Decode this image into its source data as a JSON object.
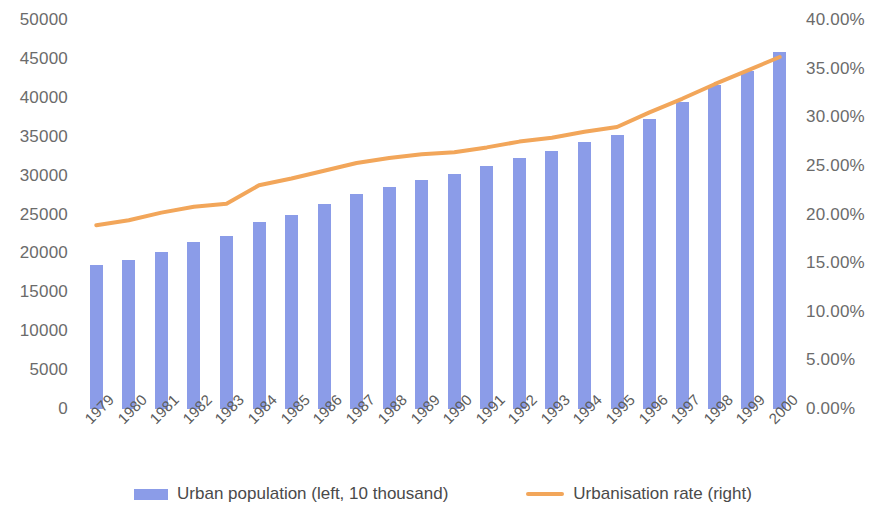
{
  "chart_data": {
    "type": "bar",
    "title": "",
    "subtitle": "",
    "xlabel": "",
    "ylabel": "",
    "grid": false,
    "legend_position": "bottom",
    "categories": [
      "1979",
      "1980",
      "1981",
      "1982",
      "1983",
      "1984",
      "1985",
      "1986",
      "1987",
      "1988",
      "1989",
      "1990",
      "1991",
      "1992",
      "1993",
      "1994",
      "1995",
      "1996",
      "1997",
      "1998",
      "1999",
      "2000"
    ],
    "axes": {
      "left": {
        "label": "",
        "ylim": [
          0,
          50000
        ],
        "ticks": [
          0,
          5000,
          10000,
          15000,
          20000,
          25000,
          30000,
          35000,
          40000,
          45000,
          50000
        ],
        "tick_labels": [
          "0",
          "5000",
          "10000",
          "15000",
          "20000",
          "25000",
          "30000",
          "35000",
          "40000",
          "45000",
          "50000"
        ]
      },
      "right": {
        "label": "",
        "ylim": [
          0,
          40
        ],
        "ticks": [
          0,
          5,
          10,
          15,
          20,
          25,
          30,
          35,
          40
        ],
        "tick_labels": [
          "0.00%",
          "5.00%",
          "10.00%",
          "15.00%",
          "20.00%",
          "25.00%",
          "30.00%",
          "35.00%",
          "40.00%"
        ]
      }
    },
    "series": [
      {
        "name": "Urban population (left, 10 thousand)",
        "type": "bar",
        "axis": "left",
        "color": "#8B9CE8",
        "values": [
          18500,
          19200,
          20200,
          21500,
          22300,
          24000,
          25000,
          26400,
          27700,
          28600,
          29500,
          30200,
          31200,
          32300,
          33200,
          34300,
          35200,
          37300,
          39400,
          41600,
          43500,
          45900
        ]
      },
      {
        "name": "Urbanisation rate (right)",
        "type": "line",
        "axis": "right",
        "color": "#F2A65A",
        "values": [
          18.9,
          19.4,
          20.2,
          20.8,
          21.1,
          23.0,
          23.7,
          24.5,
          25.3,
          25.8,
          26.2,
          26.4,
          26.9,
          27.5,
          27.9,
          28.5,
          29.0,
          30.5,
          31.9,
          33.4,
          34.8,
          36.2
        ]
      }
    ]
  },
  "legend": {
    "items": [
      {
        "label": "Urban population (left, 10 thousand)",
        "marker": "bar-swatch",
        "color": "#8B9CE8"
      },
      {
        "label": "Urbanisation rate (right)",
        "marker": "line-swatch",
        "color": "#F2A65A"
      }
    ]
  }
}
